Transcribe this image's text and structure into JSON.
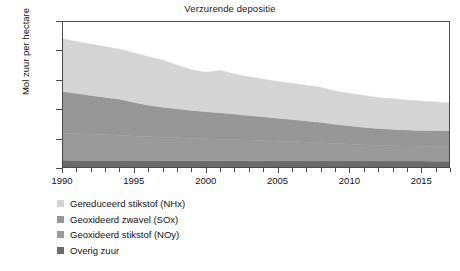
{
  "chart_data": {
    "type": "area",
    "stacked": true,
    "title": "Verzurende depositie",
    "xlabel": "",
    "ylabel": "Mol zuur per hectare",
    "ylim": [
      0,
      5000
    ],
    "xlim": [
      1990,
      2017
    ],
    "yticks": [
      0,
      1000,
      2000,
      3000,
      4000,
      5000
    ],
    "xticks": [
      1990,
      1995,
      2000,
      2005,
      2010,
      2015
    ],
    "grid": false,
    "legend_position": "below-left",
    "x": [
      1990,
      1991,
      1992,
      1993,
      1994,
      1995,
      1996,
      1997,
      1998,
      1999,
      2000,
      2001,
      2002,
      2003,
      2004,
      2005,
      2006,
      2007,
      2008,
      2009,
      2010,
      2011,
      2012,
      2013,
      2014,
      2015,
      2016,
      2017
    ],
    "series": [
      {
        "name": "Overig zuur",
        "color": "#6b6b6b",
        "values": [
          230,
          228,
          226,
          225,
          224,
          222,
          220,
          219,
          218,
          217,
          216,
          215,
          214,
          213,
          212,
          211,
          210,
          209,
          209,
          208,
          207,
          206,
          205,
          205,
          204,
          203,
          202,
          201
        ]
      },
      {
        "name": "Geoxideerd stikstof (NOy)",
        "color": "#9a9a9a",
        "values": [
          930,
          915,
          900,
          885,
          870,
          845,
          820,
          805,
          790,
          775,
          760,
          745,
          730,
          715,
          700,
          680,
          665,
          650,
          630,
          605,
          585,
          565,
          545,
          530,
          520,
          510,
          505,
          500
        ]
      },
      {
        "name": "Geoxideerd zwavel (SOx)",
        "color": "#969696",
        "values": [
          1440,
          1390,
          1340,
          1290,
          1240,
          1160,
          1090,
          1040,
          1000,
          960,
          930,
          910,
          880,
          850,
          820,
          790,
          760,
          730,
          700,
          660,
          630,
          600,
          580,
          565,
          555,
          550,
          548,
          545
        ]
      },
      {
        "name": "Gereduceerd stikstof (NHx)",
        "color": "#d4d4d4",
        "values": [
          1820,
          1790,
          1770,
          1750,
          1730,
          1700,
          1670,
          1620,
          1500,
          1400,
          1360,
          1460,
          1380,
          1330,
          1300,
          1270,
          1250,
          1230,
          1210,
          1150,
          1120,
          1100,
          1070,
          1060,
          1030,
          1010,
          990,
          970
        ]
      }
    ],
    "totals": [
      4420,
      4323,
      4236,
      4150,
      4064,
      3927,
      3800,
      3684,
      3508,
      3342,
      3266,
      3330,
      3204,
      3108,
      3032,
      2951,
      2885,
      2819,
      2749,
      2623,
      2542,
      2471,
      2400,
      2360,
      2309,
      2273,
      2245,
      2216
    ]
  },
  "axis": {
    "ylabel": "Mol zuur per hectare",
    "ytick_labels": [
      "0",
      "1000",
      "2000",
      "3000",
      "4000",
      "5000"
    ],
    "xtick_labels": [
      "1990",
      "1995",
      "2000",
      "2005",
      "2010",
      "2015"
    ]
  },
  "legend": {
    "items": [
      {
        "label": "Gereduceerd stikstof (NHx)",
        "color": "#d4d4d4"
      },
      {
        "label": "Geoxideerd zwavel (SOx)",
        "color": "#969696"
      },
      {
        "label": "Geoxideerd stikstof (NOy)",
        "color": "#9a9a9a"
      },
      {
        "label": "Overig zuur",
        "color": "#6b6b6b"
      }
    ]
  }
}
